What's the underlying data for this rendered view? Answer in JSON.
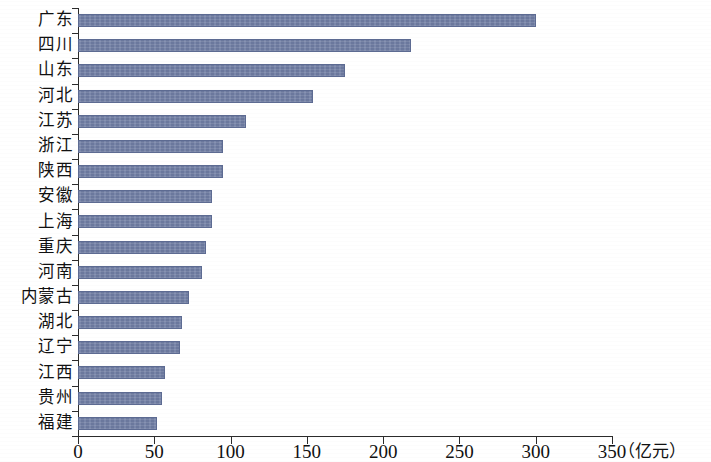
{
  "chart_data": {
    "type": "bar",
    "orientation": "horizontal",
    "title": "",
    "xlabel": "（亿元）",
    "ylabel": "",
    "xlim": [
      0,
      350
    ],
    "xticks": [
      0,
      50,
      100,
      150,
      200,
      250,
      300,
      350
    ],
    "xtick_labels": [
      "0",
      "50",
      "100",
      "150",
      "200",
      "250",
      "300",
      "350"
    ],
    "grid": false,
    "legend": false,
    "bar_color": "#6f7da3",
    "axis_color": "#2b2b2b",
    "unit": "亿元",
    "categories": [
      "广东",
      "四川",
      "山东",
      "河北",
      "江苏",
      "浙江",
      "陕西",
      "安徽",
      "上海",
      "重庆",
      "河南",
      "内蒙古",
      "湖北",
      "辽宁",
      "江西",
      "贵州",
      "福建"
    ],
    "values": [
      300,
      218,
      175,
      154,
      110,
      95,
      95,
      88,
      88,
      84,
      81,
      73,
      68,
      67,
      57,
      55,
      52
    ]
  }
}
